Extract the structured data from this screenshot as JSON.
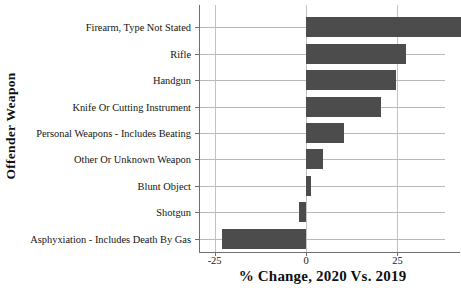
{
  "chart_data": {
    "type": "bar",
    "orientation": "horizontal",
    "title": "",
    "xlabel": "% Change, 2020 Vs. 2019",
    "ylabel": "Offender Weapon",
    "xlim": [
      -29,
      38
    ],
    "xticks": [
      -25,
      0,
      25
    ],
    "xtick_labels": [
      "-25",
      "0",
      "25"
    ],
    "grid": "both",
    "legend": "none",
    "bar_color": "#4c4c4c",
    "categories": [
      "Firearm, Type Not Stated",
      "Rifle",
      "Handgun",
      "Knife Or Cutting Instrument",
      "Personal Weapons - Includes Beating",
      "Other Or Unknown Weapon",
      "Blunt Object",
      "Shotgun",
      "Asphyxiation - Includes Death By Gas"
    ],
    "values": [
      42.3,
      27.3,
      24.6,
      20.5,
      10.4,
      4.6,
      1.4,
      -2.0,
      -23.0
    ]
  },
  "axis": {
    "x_title": "% Change, 2020 Vs. 2019",
    "y_title": "Offender Weapon"
  }
}
